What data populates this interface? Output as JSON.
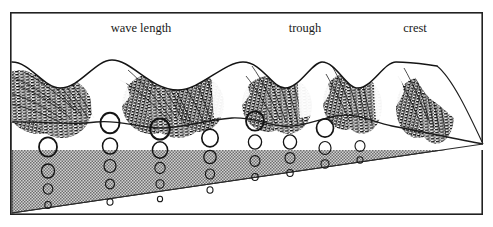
{
  "figure": {
    "name": "ocean-wave-orbital-motion-diagram",
    "background_color": "#ffffff",
    "frame": {
      "color": "#222222",
      "x": 10,
      "y": 12,
      "width": 473,
      "height": 203,
      "stroke": 1.6
    },
    "labels": [
      {
        "id": "wave-length",
        "text": "wave length",
        "x": 141,
        "y": 32,
        "anchor": "middle"
      },
      {
        "id": "trough",
        "text": "trough",
        "x": 305,
        "y": 32,
        "anchor": "middle"
      },
      {
        "id": "crest",
        "text": "crest",
        "x": 415,
        "y": 32,
        "anchor": "middle"
      }
    ],
    "colors": {
      "ink": "#1a1a1a",
      "water_fill": "#b4b4b4",
      "water_stipple": "#6e6e6e",
      "wave_shade": "#101010",
      "circle_stroke": "#141414",
      "frame": "#222222"
    },
    "surface": {
      "description": "wavy sea-surface profile, left-to-right, four crests and troughs",
      "crest_x": [
        112,
        243,
        322,
        396
      ],
      "trough_x": [
        60,
        178,
        285,
        358,
        432
      ],
      "crest_y": 62,
      "trough_y": 86
    },
    "waterline": {
      "description": "near-edge waterline of the water body, gently undulating, left to right",
      "left_y": 122,
      "right_y": 128
    },
    "perspective": {
      "description": "water block recedes to a vanishing point at the right edge",
      "vanishing_point_x": 483,
      "vanishing_point_y": 144,
      "bottom_left_x": 12,
      "bottom_left_y": 213
    },
    "orbit_columns": [
      {
        "x": 48,
        "circles": [
          {
            "cy": 147,
            "r": 9.0
          },
          {
            "cy": 171,
            "r": 6.5
          },
          {
            "cy": 189,
            "r": 4.8
          },
          {
            "cy": 205,
            "r": 3.2
          }
        ]
      },
      {
        "x": 110,
        "circles": [
          {
            "cy": 123,
            "r": 9.5
          },
          {
            "cy": 146,
            "r": 7.5
          },
          {
            "cy": 166,
            "r": 6.0
          },
          {
            "cy": 184,
            "r": 4.5
          },
          {
            "cy": 202,
            "r": 3.0
          }
        ]
      },
      {
        "x": 160,
        "circles": [
          {
            "cy": 129,
            "r": 9.8
          },
          {
            "cy": 150,
            "r": 7.6
          },
          {
            "cy": 168,
            "r": 5.2
          },
          {
            "cy": 184,
            "r": 4.0
          },
          {
            "cy": 199,
            "r": 2.6
          }
        ]
      },
      {
        "x": 210,
        "circles": [
          {
            "cy": 138,
            "r": 8.2
          },
          {
            "cy": 157,
            "r": 6.2
          },
          {
            "cy": 174,
            "r": 4.6
          },
          {
            "cy": 190,
            "r": 3.0
          }
        ]
      },
      {
        "x": 255,
        "circles": [
          {
            "cy": 121,
            "r": 9.0
          },
          {
            "cy": 142,
            "r": 6.6
          },
          {
            "cy": 161,
            "r": 5.0
          },
          {
            "cy": 177,
            "r": 3.2
          }
        ]
      },
      {
        "x": 290,
        "circles": [
          {
            "cy": 142,
            "r": 6.6
          },
          {
            "cy": 158,
            "r": 5.0
          },
          {
            "cy": 173,
            "r": 3.2
          }
        ]
      },
      {
        "x": 325,
        "circles": [
          {
            "cy": 128,
            "r": 8.5
          },
          {
            "cy": 148,
            "r": 6.0
          },
          {
            "cy": 164,
            "r": 4.0
          }
        ]
      },
      {
        "x": 360,
        "circles": [
          {
            "cy": 146,
            "r": 5.0
          },
          {
            "cy": 160,
            "r": 3.0
          }
        ]
      }
    ]
  }
}
